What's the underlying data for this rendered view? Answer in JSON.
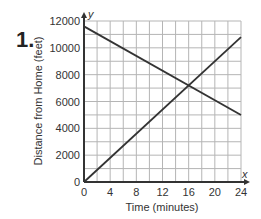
{
  "problem_number": "1.",
  "chart_data": {
    "type": "line",
    "title": "",
    "xlabel": "Time (minutes)",
    "ylabel": "Distance from Home (feet)",
    "x_axis_letter": "x",
    "y_axis_letter": "y",
    "xlim": [
      0,
      24
    ],
    "ylim": [
      0,
      12000
    ],
    "x_ticks": [
      0,
      4,
      8,
      12,
      16,
      20,
      24
    ],
    "y_ticks": [
      0,
      2000,
      4000,
      6000,
      8000,
      10000,
      12000
    ],
    "grid": true,
    "grid_x_step": 2,
    "grid_y_step": 1000,
    "legend": null,
    "series": [
      {
        "name": "decreasing line",
        "x": [
          0,
          24
        ],
        "y": [
          11600,
          5000
        ]
      },
      {
        "name": "increasing line",
        "x": [
          0,
          24
        ],
        "y": [
          0,
          10800
        ]
      }
    ],
    "intersection": {
      "x": 16,
      "y": 7200
    }
  },
  "colors": {
    "grid": "#b5b5b5",
    "axis": "#333333",
    "line": "#333333",
    "text": "#333333"
  }
}
